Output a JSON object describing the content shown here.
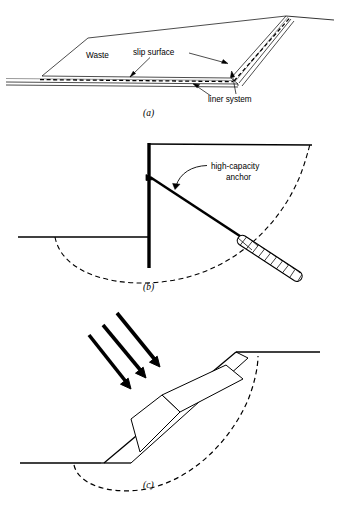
{
  "figure": {
    "panels": [
      {
        "id": "a",
        "letter": "(a)",
        "caption_letter": "(a)",
        "description": "Waste landfill on liner system with translational slip surface",
        "labels": {
          "waste": "Waste",
          "slip_surface": "slip surface",
          "liner_system": "liner system"
        }
      },
      {
        "id": "b",
        "letter": "(b)",
        "caption_letter": "(b)",
        "description": "Retaining wall with high-capacity tieback anchor crossing circular failure surface",
        "labels": {
          "anchor_line1": "high-capacity",
          "anchor_line2": "anchor"
        }
      },
      {
        "id": "c",
        "letter": "(c)",
        "caption_letter": "(c)",
        "description": "Slope with surcharge block loaded by inclined forces above circular slip surface",
        "labels": {}
      }
    ],
    "colors": {
      "line": "#000000",
      "background": "#ffffff",
      "thin_line": "#222222",
      "dash": "#000000"
    }
  }
}
